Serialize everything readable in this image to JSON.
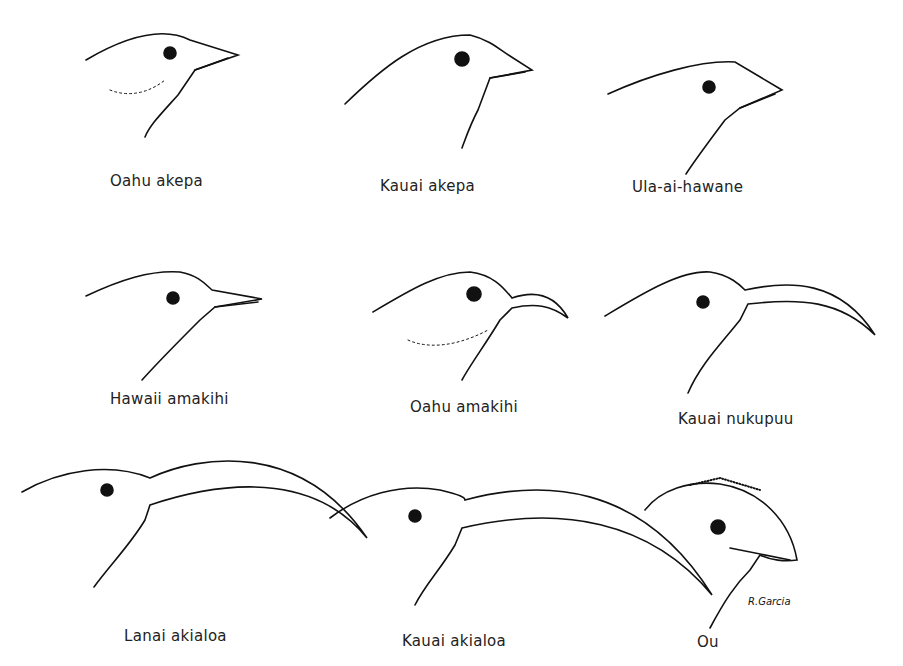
{
  "figure": {
    "type": "illustration",
    "birds": [
      {
        "name": "Oahu akepa",
        "row": 1,
        "col": 1,
        "bill": "short-conical"
      },
      {
        "name": "Kauai akepa",
        "row": 1,
        "col": 2,
        "bill": "short-conical"
      },
      {
        "name": "Ula-ai-hawane",
        "row": 1,
        "col": 3,
        "bill": "short-conical"
      },
      {
        "name": "Hawaii amakihi",
        "row": 2,
        "col": 1,
        "bill": "slender-decurved"
      },
      {
        "name": "Oahu amakihi",
        "row": 2,
        "col": 2,
        "bill": "slender-decurved"
      },
      {
        "name": "Kauai nukupuu",
        "row": 2,
        "col": 3,
        "bill": "long-decurved"
      },
      {
        "name": "Lanai akialoa",
        "row": 3,
        "col": 1,
        "bill": "very-long-decurved"
      },
      {
        "name": "Kauai akialoa",
        "row": 3,
        "col": 2,
        "bill": "very-long-decurved"
      },
      {
        "name": "Ou",
        "row": 3,
        "col": 3,
        "bill": "hooked-finch"
      }
    ],
    "signature": "R.Garcia"
  }
}
